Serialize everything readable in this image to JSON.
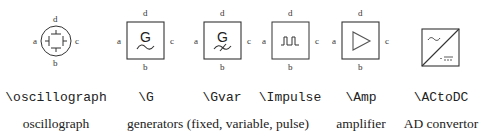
{
  "symbols": [
    {
      "id": "oscillograph",
      "command": "\\oscillograph",
      "pins": {
        "a": "a",
        "b": "b",
        "c": "c",
        "d": "d"
      }
    },
    {
      "id": "G",
      "command": "\\G",
      "glyph": "G",
      "pins": {
        "a": "a",
        "b": "b",
        "c": "c",
        "d": "d"
      }
    },
    {
      "id": "Gvar",
      "command": "\\Gvar",
      "glyph": "G",
      "pins": {
        "a": "a",
        "b": "b",
        "c": "c",
        "d": "d"
      }
    },
    {
      "id": "Impulse",
      "command": "\\Impulse",
      "pins": {
        "a": "a",
        "b": "b",
        "c": "c",
        "d": "d"
      }
    },
    {
      "id": "Amp",
      "command": "\\Amp",
      "pins": {
        "a": "a",
        "b": "b",
        "c": "c",
        "d": "d"
      }
    },
    {
      "id": "ACtoDC",
      "command": "\\ACtoDC"
    }
  ],
  "descriptions": {
    "oscillograph": "oscillograph",
    "generators": "generators (fixed, variable, pulse)",
    "amplifier": "amplifier",
    "convertor": "AD convertor"
  },
  "colors": {
    "stroke": "#333333",
    "text": "#222222",
    "background": "#ffffff"
  }
}
